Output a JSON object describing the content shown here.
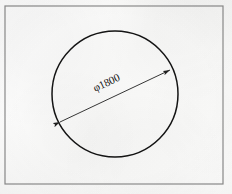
{
  "document": {
    "kind": "engineering-drawing",
    "medium": "scanned paper",
    "background_color": "#fbfbfa",
    "ink_color": "#1a1a1a"
  },
  "frame": {
    "label": "drawing border",
    "x": 5,
    "y": 6,
    "width": 218,
    "height": 178,
    "stroke_color": "#8a8a8a",
    "stroke_width": 1.2
  },
  "drawing": {
    "title": "",
    "circle": {
      "label": "circle outline",
      "center_x": 115,
      "center_y": 94,
      "radius": 63,
      "stroke_color": "#141414",
      "stroke_width": 1.5
    },
    "dimension": {
      "label": "diameter dimension",
      "text": "φ1800",
      "symbol": "φ",
      "value": "1800",
      "text_rotation_deg": -25,
      "text_x": 108,
      "text_y": 86,
      "line": {
        "x1": 60,
        "y1": 122,
        "x2": 170,
        "y2": 70,
        "stroke_color": "#202020",
        "stroke_width": 0.9,
        "arrow_start": true,
        "arrow_end": true
      }
    }
  }
}
